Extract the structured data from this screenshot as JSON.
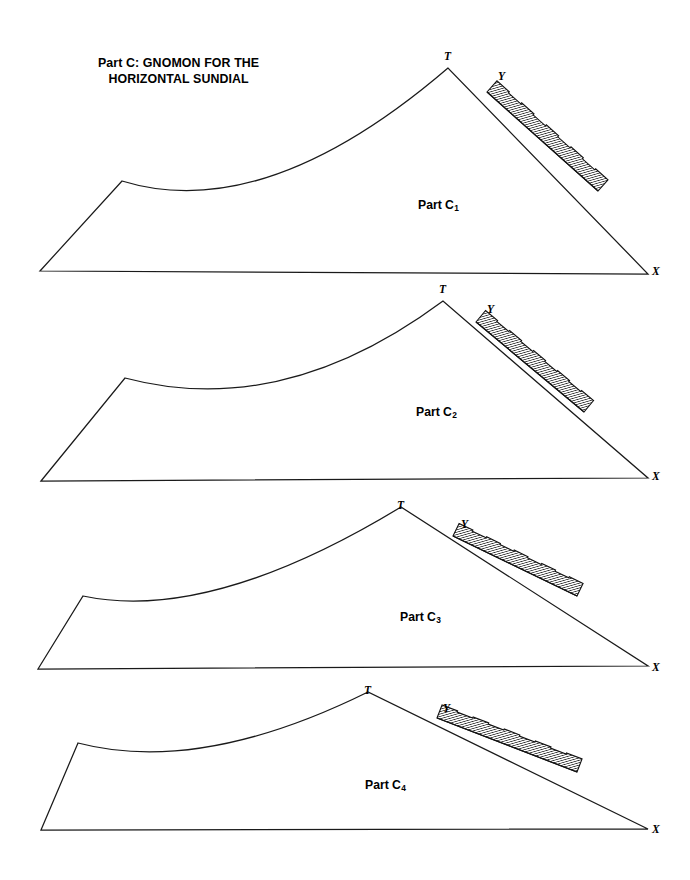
{
  "document": {
    "title_line1": "Part C: GNOMON FOR THE",
    "title_line2": "HORIZONTAL SUNDIAL",
    "background_color": "#ffffff",
    "ink_color": "#1a1a1a"
  },
  "title_block": {
    "text": "Part C: GNOMON FOR THE\nHORIZONTAL SUNDIAL",
    "x": 98,
    "y": 56
  },
  "figures": [
    {
      "id": "part-c1",
      "caption": "Part C",
      "subscript": "1",
      "caption_x": 418,
      "caption_y": 198,
      "vertex_labels": [
        {
          "name": "T",
          "text": "T",
          "x": 444,
          "y": 50
        },
        {
          "name": "Y",
          "text": "Y",
          "x": 498,
          "y": 70
        },
        {
          "name": "X",
          "text": "X",
          "x": 652,
          "y": 265
        }
      ],
      "geometry": {
        "base_left": [
          40,
          271
        ],
        "base_right": [
          648,
          274
        ],
        "hip_peak": [
          122,
          181
        ],
        "apex_T": [
          448,
          68
        ],
        "curve_control": [
          265,
          225
        ],
        "band_start": [
          487,
          92
        ],
        "band_end": [
          598,
          191
        ],
        "band_thickness": 15,
        "band_segments": 9
      }
    },
    {
      "id": "part-c2",
      "caption": "Part C",
      "subscript": "2",
      "caption_x": 416,
      "caption_y": 405,
      "vertex_labels": [
        {
          "name": "T",
          "text": "T",
          "x": 439,
          "y": 283
        },
        {
          "name": "Y",
          "text": "Y",
          "x": 487,
          "y": 303
        },
        {
          "name": "X",
          "text": "X",
          "x": 652,
          "y": 470
        }
      ],
      "geometry": {
        "base_left": [
          41,
          481
        ],
        "base_right": [
          648,
          478
        ],
        "hip_peak": [
          125,
          378
        ],
        "apex_T": [
          443,
          301
        ],
        "curve_control": [
          283,
          420
        ],
        "band_start": [
          476,
          322
        ],
        "band_end": [
          584,
          412
        ],
        "band_thickness": 15,
        "band_segments": 9
      }
    },
    {
      "id": "part-c3",
      "caption": "Part C",
      "subscript": "3",
      "caption_x": 400,
      "caption_y": 610,
      "vertex_labels": [
        {
          "name": "T",
          "text": "T",
          "x": 397,
          "y": 499
        },
        {
          "name": "Y",
          "text": "Y",
          "x": 461,
          "y": 518
        },
        {
          "name": "X",
          "text": "X",
          "x": 652,
          "y": 661
        }
      ],
      "geometry": {
        "base_left": [
          38,
          669
        ],
        "base_right": [
          648,
          666
        ],
        "hip_peak": [
          83,
          596
        ],
        "apex_T": [
          401,
          507
        ],
        "curve_control": [
          210,
          623
        ],
        "band_start": [
          453,
          536
        ],
        "band_end": [
          577,
          596
        ],
        "band_thickness": 14,
        "band_segments": 9
      }
    },
    {
      "id": "part-c4",
      "caption": "Part C",
      "subscript": "4",
      "caption_x": 365,
      "caption_y": 778,
      "vertex_labels": [
        {
          "name": "T",
          "text": "T",
          "x": 364,
          "y": 684
        },
        {
          "name": "Y",
          "text": "Y",
          "x": 443,
          "y": 702
        },
        {
          "name": "X",
          "text": "X",
          "x": 652,
          "y": 823
        }
      ],
      "geometry": {
        "base_left": [
          41,
          830
        ],
        "base_right": [
          648,
          829
        ],
        "hip_peak": [
          78,
          743
        ],
        "apex_T": [
          368,
          692
        ],
        "curve_control": [
          200,
          775
        ],
        "band_start": [
          437,
          718
        ],
        "band_end": [
          577,
          772
        ],
        "band_thickness": 14,
        "band_segments": 9
      }
    }
  ]
}
